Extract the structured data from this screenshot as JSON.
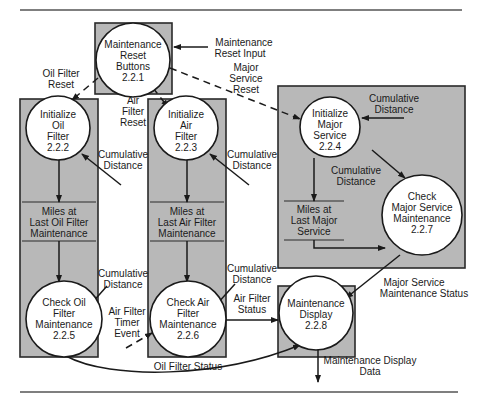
{
  "diagram": {
    "type": "data-flow-diagram",
    "processes": [
      {
        "id": "2.2.1",
        "lines": [
          "Maintenance",
          "Reset",
          "Buttons",
          "2.2.1"
        ]
      },
      {
        "id": "2.2.2",
        "lines": [
          "Initialize",
          "Oil",
          "Filter",
          "2.2.2"
        ]
      },
      {
        "id": "2.2.3",
        "lines": [
          "Initialize",
          "Air",
          "Filter",
          "2.2.3"
        ]
      },
      {
        "id": "2.2.4",
        "lines": [
          "Initialize",
          "Major",
          "Service",
          "2.2.4"
        ]
      },
      {
        "id": "2.2.5",
        "lines": [
          "Check Oil",
          "Filter",
          "Maintenance",
          "2.2.5"
        ]
      },
      {
        "id": "2.2.6",
        "lines": [
          "Check Air",
          "Filter",
          "Maintenance",
          "2.2.6"
        ]
      },
      {
        "id": "2.2.7",
        "lines": [
          "Check",
          "Major Service",
          "Maintenance",
          "2.2.7"
        ]
      },
      {
        "id": "2.2.8",
        "lines": [
          "Maintenance",
          "Display",
          "2.2.8"
        ]
      }
    ],
    "data_stores": [
      {
        "lines": [
          "Miles at",
          "Last Oil Filter",
          "Maintenance"
        ]
      },
      {
        "lines": [
          "Miles at",
          "Last Air Filter",
          "Maintenance"
        ]
      },
      {
        "lines": [
          "Miles at",
          "Last Major",
          "Service"
        ]
      }
    ],
    "flows": {
      "maintenance_reset_input": [
        "Maintenance",
        "Reset Input"
      ],
      "oil_filter_reset": [
        "Oil Filter",
        "Reset"
      ],
      "air_filter_reset": [
        "Air",
        "Filter",
        "Reset"
      ],
      "major_service_reset": [
        "Major",
        "Service",
        "Reset"
      ],
      "cum_dist_oil_init": [
        "Cumulative",
        "Distance"
      ],
      "cum_dist_air_init": [
        "Cumulative",
        "Distance"
      ],
      "cum_dist_major_init": [
        "Cumulative",
        "Distance"
      ],
      "cum_dist_major_check": [
        "Cumulative",
        "Distance"
      ],
      "cum_dist_oil_check": [
        "Cumulative",
        "Distance"
      ],
      "cum_dist_air_check": [
        "Cumulative",
        "Distance"
      ],
      "air_filter_timer_event": [
        "Air Filter",
        "Timer",
        "Event"
      ],
      "air_filter_status": [
        "Air Filter",
        "Status"
      ],
      "oil_filter_status": [
        "Oil Filter Status"
      ],
      "major_service_status": [
        "Major Service",
        "Maintenance Status"
      ],
      "maintenance_display_data": [
        "Maintenance Display",
        "Data"
      ]
    }
  }
}
